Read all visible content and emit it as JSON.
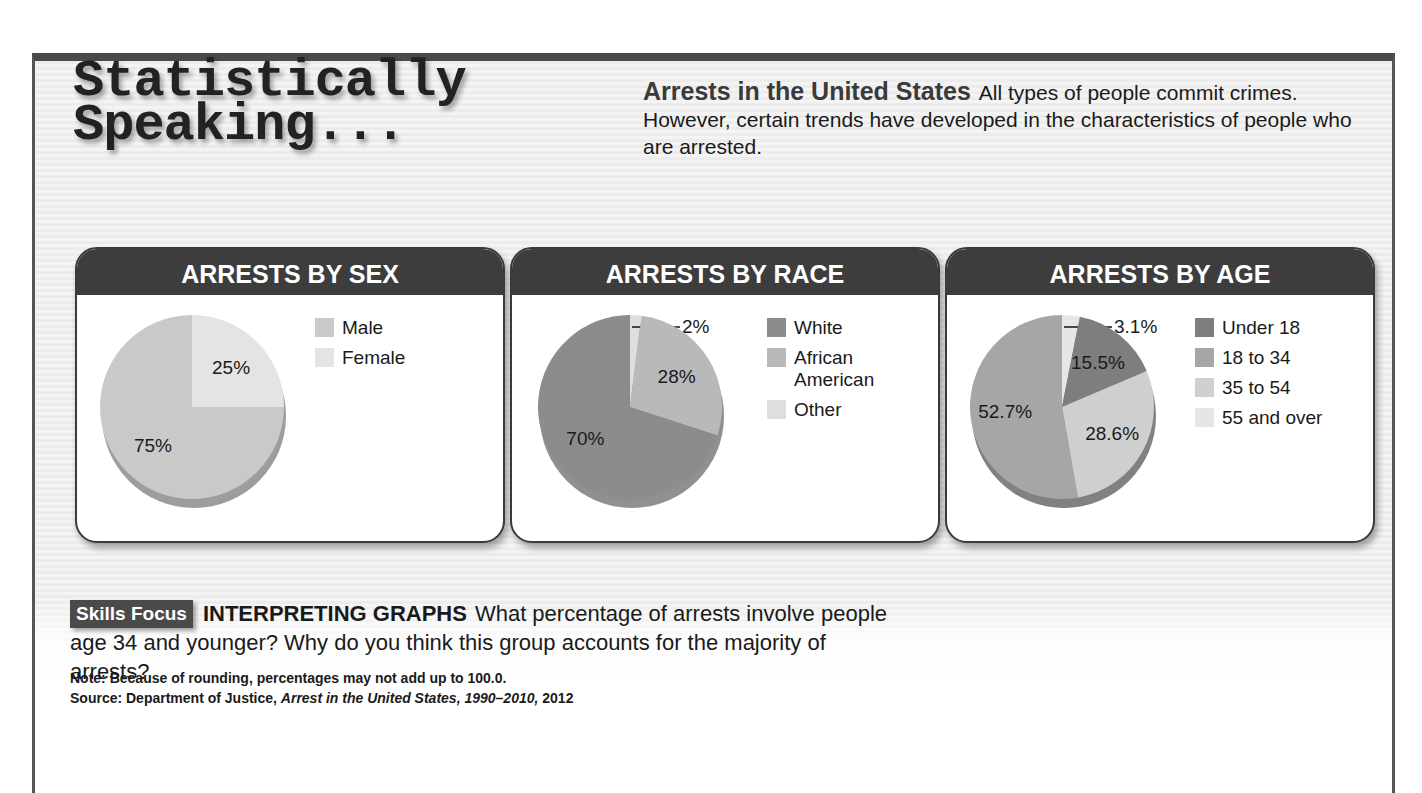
{
  "page": {
    "title_line1": "Statistically",
    "title_line2": "Speaking...",
    "intro": {
      "heading": "Arrests in the United States",
      "body": "All types of people commit crimes. However, certain trends have developed in the characteristics of people who are arrested."
    }
  },
  "skills_focus": {
    "badge": "Skills Focus",
    "caption": "INTERPRETING GRAPHS",
    "question": "What percentage of arrests involve people age 34 and younger? Why do you think this group accounts for the majority of arrests?"
  },
  "notes": {
    "note": "Note: Because of rounding, percentages may not add up to 100.0.",
    "source_prefix": "Source: Department of Justice, ",
    "source_title": "Arrest in the United States, 1990–2010,",
    "source_suffix": " 2012"
  },
  "colors": {
    "frame_border": "#4a4a4a",
    "header_bar": "#3d3d3d",
    "badge": "#4a4a4a"
  },
  "chart_data": [
    {
      "type": "pie",
      "title": "ARRESTS BY SEX",
      "categories": [
        "Male",
        "Female"
      ],
      "values": [
        75,
        25
      ],
      "labels": [
        "75%",
        "25%"
      ],
      "colors": [
        "#c9c9c9",
        "#e4e4e4"
      ],
      "legend_position": "right"
    },
    {
      "type": "pie",
      "title": "ARRESTS BY RACE",
      "categories": [
        "White",
        "African American",
        "Other"
      ],
      "values": [
        70,
        28,
        2
      ],
      "labels": [
        "70%",
        "28%",
        "2%"
      ],
      "colors": [
        "#8c8c8c",
        "#b9b9b9",
        "#dedede"
      ],
      "legend_position": "right"
    },
    {
      "type": "pie",
      "title": "ARRESTS BY AGE",
      "categories": [
        "Under 18",
        "18 to 34",
        "35 to 54",
        "55 and over"
      ],
      "values": [
        15.5,
        52.7,
        28.6,
        3.1
      ],
      "labels": [
        "15.5%",
        "52.7%",
        "28.6%",
        "3.1%"
      ],
      "colors": [
        "#7e7e7e",
        "#a6a6a6",
        "#cfcfcf",
        "#e6e6e6"
      ],
      "legend_position": "right"
    }
  ]
}
